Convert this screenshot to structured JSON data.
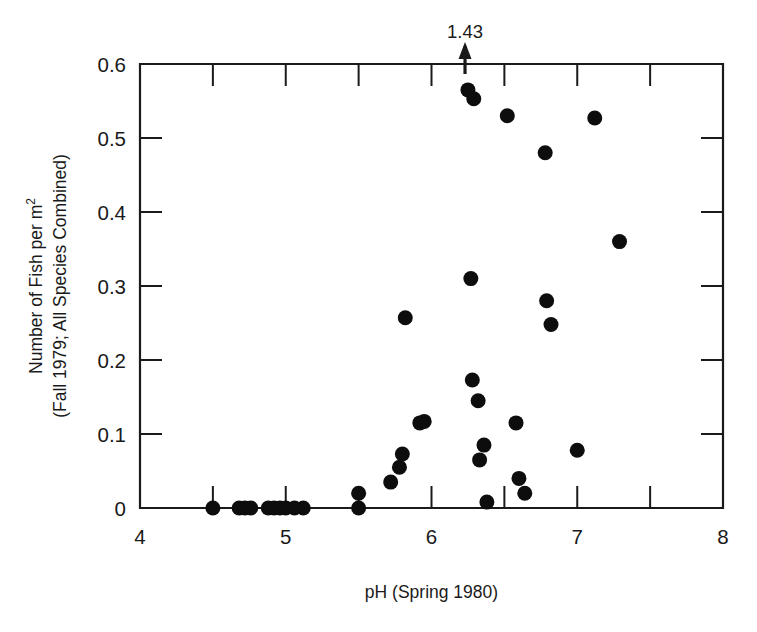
{
  "chart_data": {
    "type": "scatter",
    "title": "",
    "xlabel": "pH (Spring 1980)",
    "ylabel_line1": "Number of Fish per m",
    "ylabel_line1_sup": "2",
    "ylabel_line2": "(Fall 1979; All Species Combined)",
    "xlim": [
      4,
      8
    ],
    "ylim": [
      0,
      0.6
    ],
    "grid": false,
    "legend": null,
    "x_ticks": [
      4,
      5,
      6,
      7,
      8
    ],
    "x_tick_labels": [
      "4",
      "5",
      "6",
      "7",
      "8"
    ],
    "x_minor_ticks": [
      4.5,
      5.5,
      6.5,
      7.5
    ],
    "y_ticks": [
      0,
      0.1,
      0.2,
      0.3,
      0.4,
      0.5,
      0.6
    ],
    "y_tick_labels": [
      "0",
      "0.1",
      "0.2",
      "0.3",
      "0.4",
      "0.5",
      "0.6"
    ],
    "marker": "filled-circle",
    "marker_color": "#0d0d0d",
    "marker_radius_px": 7.5,
    "annotations": [
      {
        "text": "1.43",
        "x": 6.23,
        "y": 0.6,
        "type": "arrow-up-offscale",
        "note": "value above axis maximum"
      }
    ],
    "points": [
      {
        "x": 4.5,
        "y": 0.0
      },
      {
        "x": 4.68,
        "y": 0.0
      },
      {
        "x": 4.72,
        "y": 0.0
      },
      {
        "x": 4.76,
        "y": 0.0
      },
      {
        "x": 4.88,
        "y": 0.0
      },
      {
        "x": 4.92,
        "y": 0.0
      },
      {
        "x": 4.96,
        "y": 0.0
      },
      {
        "x": 5.0,
        "y": 0.0
      },
      {
        "x": 5.06,
        "y": 0.0
      },
      {
        "x": 5.12,
        "y": 0.0
      },
      {
        "x": 5.5,
        "y": 0.02
      },
      {
        "x": 5.5,
        "y": 0.0
      },
      {
        "x": 5.72,
        "y": 0.035
      },
      {
        "x": 5.78,
        "y": 0.055
      },
      {
        "x": 5.8,
        "y": 0.073
      },
      {
        "x": 5.82,
        "y": 0.257
      },
      {
        "x": 5.92,
        "y": 0.115
      },
      {
        "x": 5.95,
        "y": 0.117
      },
      {
        "x": 6.25,
        "y": 0.565
      },
      {
        "x": 6.29,
        "y": 0.553
      },
      {
        "x": 6.27,
        "y": 0.31
      },
      {
        "x": 6.28,
        "y": 0.173
      },
      {
        "x": 6.32,
        "y": 0.145
      },
      {
        "x": 6.36,
        "y": 0.085
      },
      {
        "x": 6.33,
        "y": 0.065
      },
      {
        "x": 6.38,
        "y": 0.008
      },
      {
        "x": 6.52,
        "y": 0.53
      },
      {
        "x": 6.58,
        "y": 0.115
      },
      {
        "x": 6.6,
        "y": 0.04
      },
      {
        "x": 6.64,
        "y": 0.02
      },
      {
        "x": 6.78,
        "y": 0.48
      },
      {
        "x": 6.79,
        "y": 0.28
      },
      {
        "x": 6.82,
        "y": 0.248
      },
      {
        "x": 7.0,
        "y": 0.078
      },
      {
        "x": 7.12,
        "y": 0.527
      },
      {
        "x": 7.29,
        "y": 0.36
      }
    ]
  }
}
